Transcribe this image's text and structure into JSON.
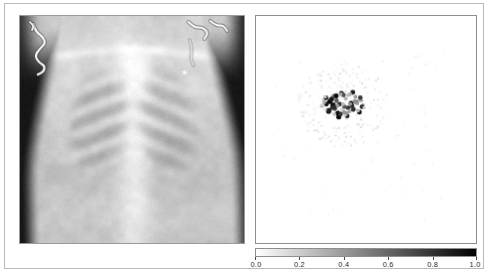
{
  "figure": {
    "background_color": "#ffffff",
    "frame_color": "#b9b9b9",
    "panel_count": 2
  },
  "left_panel": {
    "name": "chest-radiograph",
    "title": "",
    "description": "Pediatric frontal chest X-ray showing rib cage, lungs and ECG lead wires",
    "border_color": "#9a9a9a"
  },
  "right_panel": {
    "name": "attention-map",
    "title": "",
    "border_color": "#8e8e8e",
    "background_color": "#ffffff"
  },
  "colorbar": {
    "orientation": "horizontal",
    "colormap": "gray_r",
    "min_color": "#ffffff",
    "max_color": "#000000",
    "vmin": 0.0,
    "vmax": 1.0,
    "tick_values": [
      0.0,
      0.2,
      0.4,
      0.6,
      0.8,
      1.0
    ],
    "tick_labels": [
      "0.0",
      "0.2",
      "0.4",
      "0.6",
      "0.8",
      "1.0"
    ]
  },
  "chart_data": {
    "type": "scatter",
    "title": "",
    "xlabel": "",
    "ylabel": "",
    "xlim": [
      0,
      1
    ],
    "ylim": [
      0,
      1
    ],
    "grid": false,
    "legend": null,
    "colormap": "gray_r",
    "cmin": 0.0,
    "cmax": 1.0,
    "series": [
      {
        "name": "saliency points",
        "x": [
          0.32,
          0.352,
          0.418,
          0.466,
          0.372,
          0.3,
          0.44,
          0.392,
          0.346,
          0.486,
          0.414,
          0.362,
          0.33,
          0.452,
          0.402,
          0.308,
          0.47,
          0.428,
          0.38,
          0.356,
          0.336,
          0.444,
          0.398,
          0.464,
          0.318,
          0.37,
          0.432,
          0.406,
          0.346,
          0.478,
          0.388,
          0.324,
          0.456,
          0.412,
          0.364,
          0.302,
          0.482,
          0.424,
          0.342,
          0.396,
          0.358,
          0.448,
          0.376,
          0.314,
          0.436,
          0.408,
          0.384,
          0.46,
          0.332,
          0.42,
          0.366,
          0.492,
          0.35,
          0.4,
          0.474,
          0.31,
          0.442,
          0.386,
          0.354,
          0.428
        ],
        "y": [
          0.612,
          0.648,
          0.596,
          0.628,
          0.572,
          0.604,
          0.664,
          0.588,
          0.636,
          0.608,
          0.56,
          0.62,
          0.58,
          0.644,
          0.6,
          0.632,
          0.576,
          0.656,
          0.612,
          0.568,
          0.624,
          0.592,
          0.652,
          0.584,
          0.64,
          0.604,
          0.616,
          0.564,
          0.596,
          0.628,
          0.66,
          0.588,
          0.62,
          0.572,
          0.648,
          0.608,
          0.6,
          0.58,
          0.632,
          0.612,
          0.592,
          0.624,
          0.556,
          0.644,
          0.604,
          0.636,
          0.568,
          0.616,
          0.584,
          0.652,
          0.628,
          0.596,
          0.608,
          0.576,
          0.64,
          0.62,
          0.588,
          0.656,
          0.6,
          0.612
        ],
        "c": [
          0.92,
          0.44,
          0.78,
          0.22,
          0.96,
          0.35,
          0.88,
          0.18,
          0.72,
          0.3,
          0.85,
          0.26,
          0.94,
          0.4,
          0.66,
          0.2,
          0.9,
          0.33,
          0.8,
          0.24,
          0.98,
          0.48,
          0.7,
          0.28,
          0.86,
          0.38,
          0.93,
          0.21,
          0.76,
          0.32,
          0.89,
          0.25,
          0.68,
          0.42,
          0.95,
          0.19,
          0.82,
          0.36,
          0.91,
          0.27,
          0.74,
          0.46,
          0.97,
          0.23,
          0.84,
          0.31,
          0.79,
          0.39,
          0.87,
          0.29,
          0.65,
          0.17,
          0.99,
          0.43,
          0.77,
          0.34,
          0.81,
          0.37,
          0.83,
          0.41
        ],
        "marker": "o",
        "marker_size": 2.2
      }
    ]
  }
}
